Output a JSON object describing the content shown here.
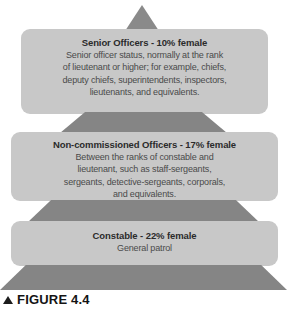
{
  "figure": {
    "caption_marker": "▲",
    "caption_text": "FIGURE 4.4",
    "colors": {
      "panel_fill": "#c8c8c8",
      "connector_fill": "#858585",
      "apex_fill": "#8a8a8a",
      "background": "#ffffff",
      "title_text": "#2b2b2b",
      "body_text": "#4a4a4a"
    }
  },
  "chart_data": {
    "type": "pyramid",
    "title": "FIGURE 4.4",
    "orientation": "vertical-top-narrow",
    "value_label": "% female",
    "categories": [
      "Senior Officers",
      "Non-commissioned Officers",
      "Constable"
    ],
    "values": [
      10,
      17,
      22
    ],
    "tiers": [
      {
        "rank": "Senior Officers",
        "percent_female": 10,
        "title": "Senior Officers - 10% female",
        "description": "Senior officer status, normally at the rank of lieutenant or higher; for example, chiefs, deputy chiefs, superintendents, inspectors, lieutenants, and equivalents.",
        "lines": [
          "Senior officer status, normally at the rank",
          "of lieutenant or higher; for example, chiefs,",
          "deputy chiefs, superintendents, inspectors,",
          "lieutenants, and equivalents."
        ]
      },
      {
        "rank": "Non-commissioned Officers",
        "percent_female": 17,
        "title": "Non-commissioned Officers - 17% female",
        "description": "Between the ranks of constable and lieutenant, such as staff-sergeants, sergeants, detective-sergeants, corporals, and equivalents.",
        "lines": [
          "Between the ranks of constable and",
          "lieutenant, such as staff-sergeants,",
          "sergeants, detective-sergeants, corporals,",
          "and equivalents."
        ]
      },
      {
        "rank": "Constable",
        "percent_female": 22,
        "title": "Constable - 22% female",
        "description": "General patrol",
        "lines": [
          "General patrol"
        ]
      }
    ]
  }
}
